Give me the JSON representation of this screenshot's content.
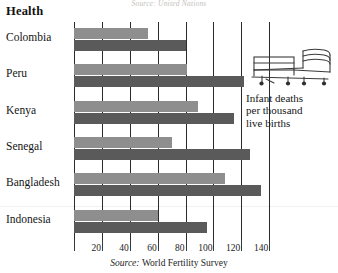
{
  "bleed_top_text": "Source: United Nations",
  "title": "Health",
  "source": {
    "label": "Source:",
    "value": "World Fertility Survey"
  },
  "legend": {
    "icon": "hospital-bed-icon",
    "line1": "Infant deaths",
    "line2": "per thousand",
    "line3": "live births"
  },
  "axis": {
    "ticks": [
      "20",
      "40",
      "60",
      "80",
      "100",
      "120",
      "140"
    ],
    "tick_values": [
      20,
      40,
      60,
      80,
      100,
      120,
      140
    ],
    "min": 0,
    "max": 152
  },
  "colors": {
    "bar_light": "#8e8e8e",
    "bar_dark": "#5a5a5a",
    "gridline": "#2b2b2b",
    "text": "#151515"
  },
  "rows": [
    {
      "label": "Colombia",
      "light": 53,
      "dark": 80
    },
    {
      "label": "Peru",
      "light": 81,
      "dark": 122
    },
    {
      "label": "Kenya",
      "light": 89,
      "dark": 115
    },
    {
      "label": "Senegal",
      "light": 70,
      "dark": 126
    },
    {
      "label": "Bangladesh",
      "light": 108,
      "dark": 134
    },
    {
      "label": "Indonesia",
      "light": 60,
      "dark": 95
    }
  ],
  "chart_data": {
    "type": "bar",
    "orientation": "horizontal",
    "title": "Health",
    "subtitle": "Infant deaths per thousand live births",
    "xlabel": "",
    "ylabel": "",
    "categories": [
      "Colombia",
      "Peru",
      "Kenya",
      "Senegal",
      "Bangladesh",
      "Indonesia"
    ],
    "series": [
      {
        "name": "light-series",
        "color": "#8e8e8e",
        "values": [
          53,
          81,
          89,
          70,
          108,
          60
        ]
      },
      {
        "name": "dark-series",
        "color": "#5a5a5a",
        "values": [
          80,
          122,
          115,
          126,
          134,
          95
        ]
      }
    ],
    "xlim": [
      0,
      152
    ],
    "xticks": [
      20,
      40,
      60,
      80,
      100,
      120,
      140
    ],
    "grid": true,
    "grid_axis": "x",
    "legend": "none",
    "source": "Source: World Fertility Survey"
  }
}
